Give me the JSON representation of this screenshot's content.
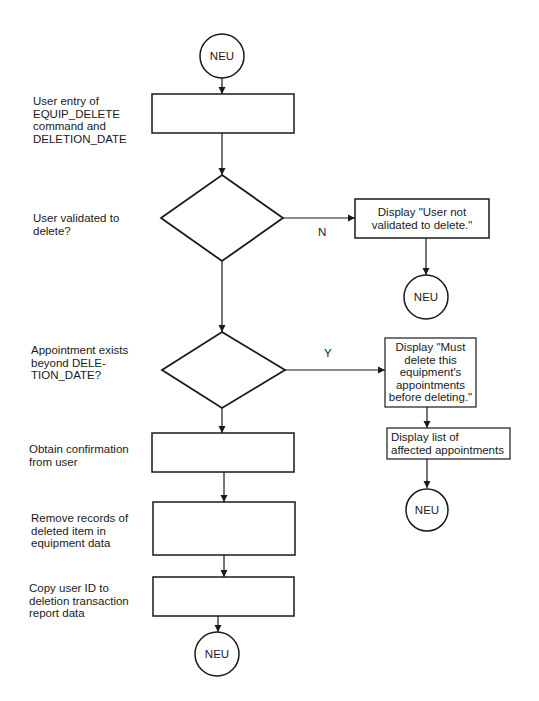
{
  "terminals": {
    "start": "NEU",
    "end_not_validated": "NEU",
    "end_appointments": "NEU",
    "end_main": "NEU"
  },
  "steps": {
    "user_entry": {
      "description": "User entry of\nEQUIP_DELETE\ncommand and\nDELETION_DATE"
    },
    "decision_validated": {
      "question": "User validated to\ndelete?",
      "no_label": "N"
    },
    "display_not_validated": {
      "text": "Display \"User not\nvalidated to delete.\""
    },
    "decision_appointments": {
      "question": "Appointment exists\nbeyond DELE-\nTION_DATE?",
      "yes_label": "Y"
    },
    "display_must_delete": {
      "text": "Display \"Must\ndelete this\nequipment's\nappointments\nbefore deleting.\""
    },
    "display_list": {
      "text": "Display list of\naffected appointments"
    },
    "obtain_confirmation": {
      "description": "Obtain confirmation\nfrom user"
    },
    "remove_records": {
      "description": "Remove records of\ndeleted item in\nequipment data"
    },
    "copy_user_id": {
      "description": "Copy user ID to\ndeletion transaction\nreport data"
    }
  },
  "colors": {
    "stroke": "#1a1a1a",
    "background": "#ffffff"
  }
}
